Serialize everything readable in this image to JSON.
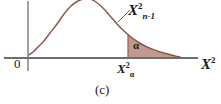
{
  "figure": {
    "caption": "(c)",
    "origin_label": "0",
    "distribution_label": {
      "base": "X",
      "superscript": "2",
      "subscript": "n-1"
    },
    "x_axis_label": {
      "base": "X",
      "superscript": "2"
    },
    "critical_value_label": {
      "base": "X",
      "superscript": "2",
      "subscript": "α"
    },
    "shaded_area_label": "α",
    "colors": {
      "curve": "#8a5a4a",
      "shade_fill": "#c09288",
      "axis": "#6e6e6e",
      "background": "#ffffff",
      "text": "#1a1a1a"
    }
  },
  "chart_data": {
    "type": "line",
    "title": "",
    "subtitle": "",
    "xlabel": "X^2",
    "ylabel": "",
    "grid": false,
    "legend_position": "inline-annotation",
    "annotations": [
      {
        "text": "X^2_{n-1}",
        "role": "curve-label",
        "x_px": 128,
        "y_px": 2
      },
      {
        "text": "α",
        "role": "shaded-area-label",
        "x_px": 133,
        "y_px": 40
      },
      {
        "text": "X^2_α",
        "role": "critical-value-tick",
        "x_px": 117,
        "y_px": 62
      },
      {
        "text": "0",
        "role": "origin",
        "x_px": 14,
        "y_px": 57
      },
      {
        "text": "(c)",
        "role": "figure-caption",
        "x_px": 95,
        "y_px": 83
      }
    ],
    "axis_baseline_y_px": 58,
    "y_axis_x_px": 28,
    "x_axis_from_px": 4,
    "x_axis_to_px": 198,
    "critical_value_x_px": 128,
    "shade_end_x_px": 180,
    "series": [
      {
        "name": "chi-square density (n-1 df)",
        "points_px": [
          [
            29,
            55
          ],
          [
            33,
            52
          ],
          [
            38,
            47
          ],
          [
            44,
            41
          ],
          [
            50,
            33
          ],
          [
            57,
            24
          ],
          [
            64,
            14
          ],
          [
            71,
            6
          ],
          [
            78,
            1
          ],
          [
            84,
            -1
          ],
          [
            90,
            -1
          ],
          [
            96,
            2
          ],
          [
            103,
            8
          ],
          [
            110,
            16
          ],
          [
            117,
            24
          ],
          [
            124,
            31
          ],
          [
            131,
            37
          ],
          [
            138,
            42
          ],
          [
            145,
            46
          ],
          [
            152,
            49
          ],
          [
            160,
            52
          ],
          [
            168,
            54
          ],
          [
            175,
            56
          ],
          [
            180,
            57
          ]
        ]
      }
    ],
    "shaded_region": {
      "name": "right tail rejection region",
      "label": "α",
      "from_x_px": 128,
      "to_x_px": 180
    }
  }
}
